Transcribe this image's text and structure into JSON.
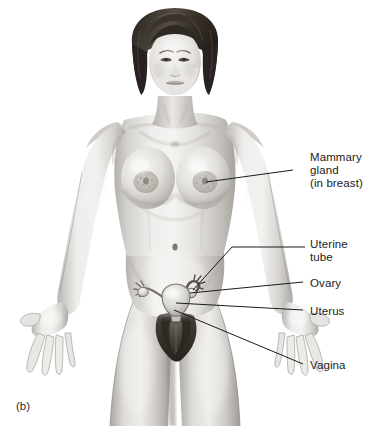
{
  "figure": {
    "caption": "(b)",
    "style": "grayscale airbrush / pencil medical illustration",
    "background_color": "#ffffff",
    "line_color": "#1b1b1b",
    "text_color": "#1b1b1b"
  },
  "labels": [
    {
      "id": "mammary-gland",
      "lines": [
        "Mammary",
        "gland",
        "(in breast)"
      ],
      "text_x": 310,
      "text_y": 151,
      "leader": {
        "x1": 293,
        "y1": 170,
        "x2": 206,
        "y2": 182
      }
    },
    {
      "id": "uterine-tube",
      "lines": [
        "Uterine",
        "tube"
      ],
      "text_x": 310,
      "text_y": 238,
      "leader_path": "M 305 247 L 232 247 L 193 290",
      "leader": {
        "x1": 305,
        "y1": 247,
        "x2": 193,
        "y2": 290
      }
    },
    {
      "id": "ovary",
      "lines": [
        "Ovary"
      ],
      "text_x": 310,
      "text_y": 277,
      "leader": {
        "x1": 303,
        "y1": 282,
        "x2": 190,
        "y2": 293
      }
    },
    {
      "id": "uterus",
      "lines": [
        "Uterus"
      ],
      "text_x": 310,
      "text_y": 305,
      "leader": {
        "x1": 303,
        "y1": 310,
        "x2": 176,
        "y2": 303
      }
    },
    {
      "id": "vagina",
      "lines": [
        "Vagina"
      ],
      "text_x": 310,
      "text_y": 359,
      "leader": {
        "x1": 303,
        "y1": 364,
        "x2": 174,
        "y2": 310
      }
    }
  ],
  "caption_position": {
    "x": 16,
    "y": 406
  },
  "palette": {
    "skin_highlight": "#f2f1ef",
    "skin_light": "#e2e0dd",
    "skin_mid": "#c9c7c3",
    "skin_shadow": "#a9a6a1",
    "skin_deep": "#8d8a85",
    "hair_dark": "#2b2723",
    "hair_mid": "#4a433c",
    "organ_light": "#efeeec",
    "organ_mid": "#cfcdc9",
    "organ_shadow": "#9d9a95",
    "pubic_dark": "#3a3732",
    "outline": "#1b1b1b"
  }
}
